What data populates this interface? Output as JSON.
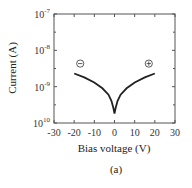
{
  "chart_data": {
    "type": "line",
    "title": "",
    "xlabel": "Bias voltage (V)",
    "ylabel": "Current (A)",
    "caption": "(a)",
    "xlim": [
      -30,
      30
    ],
    "ylim_log10": [
      -10,
      -7
    ],
    "yscale": "log",
    "xticks": [
      "-30",
      "-20",
      "-10",
      "0",
      "10",
      "20",
      "30"
    ],
    "yticks": [
      {
        "base": "10",
        "exp": "-7"
      },
      {
        "base": "10",
        "exp": "-8"
      },
      {
        "base": "10",
        "exp": "-9"
      },
      {
        "base": "10",
        "exp": "10"
      }
    ],
    "grid": false,
    "annotations": [
      {
        "text": "⊖",
        "meaning": "negative bias",
        "x": -17,
        "y": 2.6e-09
      },
      {
        "text": "⊕",
        "meaning": "positive bias",
        "x": 17,
        "y": 2.6e-09
      }
    ],
    "series": [
      {
        "name": "I-V",
        "x": [
          -20,
          -15,
          -10,
          -6,
          -3,
          -1.5,
          -0.5,
          0,
          0.5,
          1.5,
          3,
          6,
          10,
          15,
          20
        ],
        "y": [
          2.3e-09,
          1.8e-09,
          1.3e-09,
          9e-10,
          6e-10,
          4e-10,
          2.5e-10,
          1.8e-10,
          2.5e-10,
          4e-10,
          6e-10,
          9e-10,
          1.3e-09,
          1.8e-09,
          2.3e-09
        ]
      }
    ]
  }
}
